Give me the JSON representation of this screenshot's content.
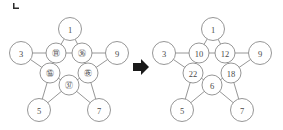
{
  "figure": {
    "corner_mark": "crop-corner-mark",
    "arrow": {
      "name": "right-arrow",
      "glyph": "➡",
      "color": "#1a1a1a"
    },
    "colors": {
      "stroke": "#8a8a8a",
      "text": "#4a4a4a",
      "fill": "#ffffff",
      "arrow": "#1a1a1a"
    }
  },
  "left_star": {
    "name": "star-diagram-unsolved",
    "outer_nodes": [
      {
        "id": "top",
        "label": "1",
        "cx": 70,
        "cy": 29
      },
      {
        "id": "left",
        "label": "3",
        "cx": 21,
        "cy": 53
      },
      {
        "id": "right",
        "label": "9",
        "cx": 117,
        "cy": 53
      },
      {
        "id": "bottom_left",
        "label": "5",
        "cx": 39,
        "cy": 110
      },
      {
        "id": "bottom_right",
        "label": "7",
        "cx": 99,
        "cy": 110
      }
    ],
    "inner_nodes": [
      {
        "id": "inner_top_left",
        "label": "㊮",
        "cx": 56,
        "cy": 53
      },
      {
        "id": "inner_top_right",
        "label": "㊱",
        "cx": 82,
        "cy": 53
      },
      {
        "id": "inner_left",
        "label": "㊯",
        "cx": 50,
        "cy": 73
      },
      {
        "id": "inner_right",
        "label": "㊰",
        "cx": 88,
        "cy": 73
      },
      {
        "id": "inner_bottom",
        "label": "㊲",
        "cx": 69,
        "cy": 85
      }
    ]
  },
  "right_star": {
    "name": "star-diagram-solved",
    "outer_nodes": [
      {
        "id": "top",
        "label": "1",
        "cx": 213,
        "cy": 29
      },
      {
        "id": "left",
        "label": "3",
        "cx": 164,
        "cy": 53
      },
      {
        "id": "right",
        "label": "9",
        "cx": 260,
        "cy": 53
      },
      {
        "id": "bottom_left",
        "label": "5",
        "cx": 182,
        "cy": 110
      },
      {
        "id": "bottom_right",
        "label": "7",
        "cx": 242,
        "cy": 110
      }
    ],
    "inner_nodes": [
      {
        "id": "inner_top_left",
        "label": "10",
        "cx": 199,
        "cy": 53
      },
      {
        "id": "inner_top_right",
        "label": "12",
        "cx": 225,
        "cy": 53
      },
      {
        "id": "inner_left",
        "label": "22",
        "cx": 193,
        "cy": 73
      },
      {
        "id": "inner_right",
        "label": "18",
        "cx": 231,
        "cy": 73
      },
      {
        "id": "inner_bottom",
        "label": "6",
        "cx": 212,
        "cy": 85
      }
    ]
  }
}
